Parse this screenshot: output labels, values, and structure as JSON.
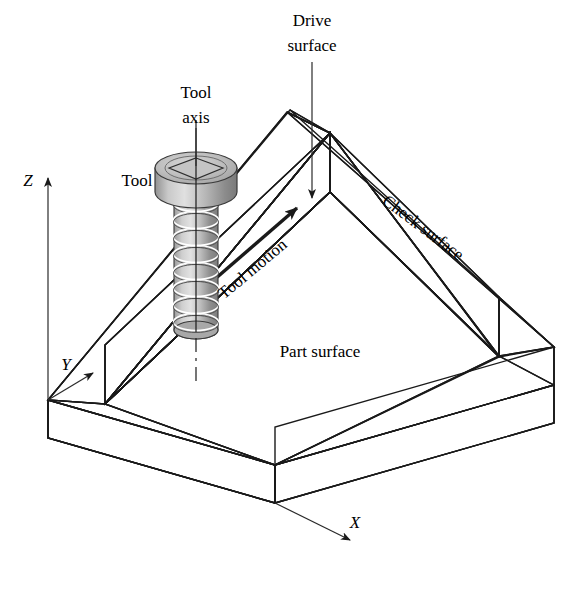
{
  "figure": {
    "background_color": "#ffffff",
    "width": 577,
    "height": 593
  },
  "labels": {
    "tool_axis_line1": "Tool",
    "tool_axis_line2": "axis",
    "tool": "Tool",
    "drive_surface_line1": "Drive",
    "drive_surface_line2": "surface",
    "check_surface": "Check surface",
    "part_surface": "Part surface",
    "tool_motion": "Tool motion",
    "axis_x": "X",
    "axis_y": "Y",
    "axis_z": "Z"
  },
  "icons": {
    "tool_axis_leader": "leader-line-with-no-arrow",
    "drive_surface_leader": "leader-line-arrow-down",
    "tool_motion": "motion-arrow-right",
    "axis_x_arrow": "arrow-down-right",
    "axis_y_arrow": "arrow-up-right",
    "axis_z_arrow": "arrow-up"
  },
  "colors": {
    "outline": "#1a1a1a",
    "part_surface_floor": "#efefef",
    "wall_top_rim": "#ededed",
    "check_surface_face": "#dcdcdc",
    "drive_surface_face": "#a9a9a9",
    "outer_side_right": "#9c9c9c",
    "outer_side_left": "#cfcfcf",
    "tool_body_light": "#d9d9d9",
    "tool_body_dark": "#8e8e8e",
    "text": "#000000"
  },
  "geometry": {
    "projection": "isometric",
    "block_type": "rectangular pocket with raised walls",
    "tool_type": "end mill with helical flutes",
    "tool_flute_rings": 8,
    "origin_point": "lower-left corner of block"
  }
}
